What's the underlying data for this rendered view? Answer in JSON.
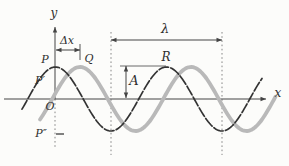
{
  "figure": {
    "background": "#fcfcfa",
    "ink_color": "#2e2e2e",
    "dimension_color": "#444444",
    "guide_color": "#7a7a7a"
  },
  "canvas": {
    "width": 289,
    "height": 166
  },
  "axes": {
    "x_axis": {
      "label": "x",
      "y": 99,
      "x1": 4,
      "x2": 266,
      "label_x": 278,
      "label_y": 93
    },
    "y_axis": {
      "label": "y",
      "x": 55,
      "y_top": 27,
      "y_cross": 99,
      "dashed_bottom": 148,
      "label_x": 54,
      "label_y": 13
    },
    "origin": {
      "label": "O",
      "x": 50,
      "y": 107
    }
  },
  "chart_data": {
    "type": "line",
    "title": "",
    "xlabel": "x",
    "ylabel": "y",
    "axis_y_px": 99,
    "amplitude_px": 32,
    "wavelength_px": 111,
    "series": [
      {
        "name": "wave-shifted-later",
        "crest_x": 80,
        "x_start": 40,
        "x_end": 276,
        "color": "#b9b9b9",
        "stroke_width": 3.8,
        "dash": ""
      },
      {
        "name": "wave-initial",
        "crest_x": 55.5,
        "x_start": 22,
        "x_end": 262,
        "color": "#333333",
        "stroke_width": 1.7,
        "dash": "10 2.4"
      }
    ]
  },
  "dimensions": {
    "wavelength": {
      "label": "λ",
      "arrow_y": 40,
      "x1": 111,
      "x2": 222,
      "label_x": 165,
      "label_y": 29,
      "guide_top": 32,
      "guide_bottom": 155
    },
    "phase_shift": {
      "label": "Δx",
      "arrow_y": 50,
      "x1": 56,
      "x2": 80,
      "label_x": 67,
      "label_y": 41,
      "tick_x": 80,
      "tick_y1": 44,
      "tick_y2": 60
    },
    "amplitude": {
      "label": "A",
      "arrow_x": 126,
      "y1": 66,
      "y2": 98,
      "label_x": 134,
      "label_y": 81,
      "crest_line": {
        "x1": 120,
        "x2": 166,
        "y": 66
      }
    }
  },
  "points": [
    {
      "label": "P",
      "x": 45,
      "y": 60,
      "size": 11
    },
    {
      "label": "P′",
      "x": 40,
      "y": 81,
      "size": 11
    },
    {
      "label": "P″",
      "x": 41,
      "y": 134,
      "size": 11
    },
    {
      "label": "Q",
      "x": 89,
      "y": 59,
      "size": 11
    },
    {
      "label": "R",
      "x": 166,
      "y": 57,
      "size": 12
    },
    {
      "label": "O",
      "x": 50,
      "y": 107,
      "size": 11
    }
  ],
  "p_double_prime_tick": {
    "x1": 56,
    "x2": 64,
    "y": 134
  },
  "axis_labels": [
    {
      "label": "y",
      "x": 54,
      "y": 13,
      "size": 12
    },
    {
      "label": "x",
      "x": 278,
      "y": 93,
      "size": 12
    }
  ],
  "dim_labels": [
    {
      "label": "Δx",
      "x": 67,
      "y": 41,
      "size": 11
    },
    {
      "label": "λ",
      "x": 165,
      "y": 29,
      "size": 13
    },
    {
      "label": "A",
      "x": 134,
      "y": 81,
      "size": 13
    }
  ]
}
